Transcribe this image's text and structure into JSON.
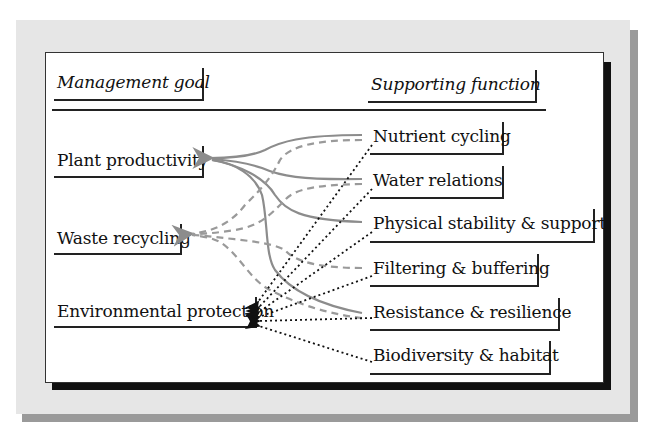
{
  "figure": {
    "headers": {
      "management_goal": "Management goal",
      "supporting_function": "Supporting function"
    },
    "goals": [
      {
        "id": "plant",
        "label": "Plant productivity"
      },
      {
        "id": "waste",
        "label": "Waste recycling"
      },
      {
        "id": "env",
        "label": "Environmental protection"
      }
    ],
    "functions": [
      {
        "id": "nutrient",
        "label": "Nutrient cycling"
      },
      {
        "id": "water",
        "label": "Water relations"
      },
      {
        "id": "physical",
        "label": "Physical stability & support"
      },
      {
        "id": "filtering",
        "label": "Filtering & buffering"
      },
      {
        "id": "resistance",
        "label": "Resistance & resilience"
      },
      {
        "id": "biodiversity",
        "label": "Biodiversity & habitat"
      }
    ],
    "connections": {
      "plant_productivity_solid": [
        "Nutrient cycling",
        "Water relations",
        "Physical stability & support",
        "Resistance & resilience"
      ],
      "waste_recycling_dashed": [
        "Nutrient cycling",
        "Water relations",
        "Filtering & buffering",
        "Resistance & resilience"
      ],
      "environmental_protection_dotted": [
        "Nutrient cycling",
        "Water relations",
        "Physical stability & support",
        "Filtering & buffering",
        "Resistance & resilience",
        "Biodiversity & habitat"
      ]
    },
    "legend_styles": {
      "plant_productivity": "solid gray",
      "waste_recycling": "dashed gray",
      "environmental_protection": "dotted black"
    },
    "colors": {
      "panel": "#e6e6e6",
      "panel_shadow": "#9a9a9a",
      "card_shadow": "#111111",
      "solid_line": "#8c8c8c",
      "dashed_line": "#9a9a9a",
      "dotted_line": "#111111"
    }
  }
}
